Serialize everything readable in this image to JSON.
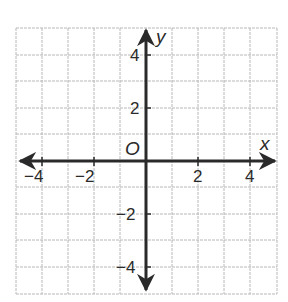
{
  "diagram": {
    "type": "coordinate-plane",
    "x_axis": {
      "label": "x",
      "min": -5,
      "max": 5,
      "tick_labels": [
        "−4",
        "−2",
        "2",
        "4"
      ],
      "tick_values": [
        -4,
        -2,
        2,
        4
      ]
    },
    "y_axis": {
      "label": "y",
      "min": -5,
      "max": 5,
      "tick_labels": [
        "4",
        "2",
        "−2",
        "−4"
      ],
      "tick_values": [
        4,
        2,
        -2,
        -4
      ]
    },
    "origin_label": "O",
    "grid": {
      "step": 1,
      "visible": true
    },
    "colors": {
      "axis": "#2a2a2a",
      "grid": "#b8b8b8",
      "text": "#2a2a2a"
    }
  }
}
